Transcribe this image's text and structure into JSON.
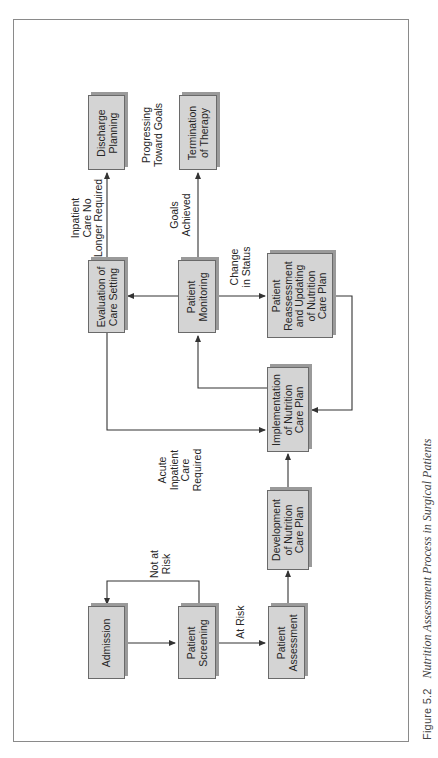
{
  "figure": {
    "number": "Figure 5.2",
    "title": "Nutrition Assessment Process in Surgical Patients"
  },
  "nodes": {
    "admission": "Admission",
    "screening": "Patient\nScreening",
    "assessment": "Patient\nAssessment",
    "development": "Development\nof Nutrition\nCare Plan",
    "implementation": "Implementation\nof Nutrition\nCare Plan",
    "reassessment": "Patient\nReassessment\nand Updating\nof Nutrition\nCare Plan",
    "monitoring": "Patient\nMonitoring",
    "evaluation": "Evaluation of\nCare Setting",
    "discharge": "Discharge\nPlanning",
    "termination": "Termination\nof Therapy"
  },
  "edge_labels": {
    "not_at_risk": "Not at\nRisk",
    "at_risk": "At Risk",
    "acute_inpatient": "Acute\nInpatient\nCare\nRequired",
    "change_in_status": "Change\nin Status",
    "goals_achieved": "Goals\nAchieved",
    "inpatient_no_longer": "Inpatient\nCare No\nLonger Required",
    "progressing": "Progressing\nToward Goals"
  },
  "colors": {
    "box_fill": "#d4d4d4",
    "box_border": "#6a6a6a",
    "line": "#333333",
    "frame": "#8a8a8a"
  }
}
